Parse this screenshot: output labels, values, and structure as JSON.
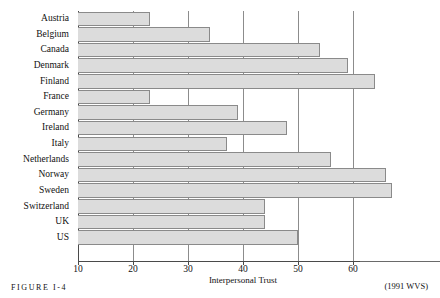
{
  "figure": {
    "caption": "FIGURE I-4",
    "source_note": "(1991 WVS)"
  },
  "chart_data": {
    "type": "bar",
    "orientation": "horizontal",
    "title": "",
    "xlabel": "Interpersonal Trust",
    "ylabel": "",
    "xlim": [
      10,
      68
    ],
    "xticks": [
      10,
      20,
      30,
      40,
      50,
      60
    ],
    "xtick_labels": [
      "10",
      "20",
      "30",
      "40",
      "50",
      "60"
    ],
    "grid": true,
    "legend": false,
    "bar_color": "#dcdcdc",
    "bar_border_color": "#8a8a8a",
    "axis_color": "#4a4a4a",
    "categories": [
      "Austria",
      "Belgium",
      "Canada",
      "Denmark",
      "Finland",
      "France",
      "Germany",
      "Ireland",
      "Italy",
      "Netherlands",
      "Norway",
      "Sweden",
      "Switzerland",
      "UK",
      "US"
    ],
    "values": [
      23,
      34,
      54,
      59,
      64,
      23,
      39,
      48,
      37,
      56,
      66,
      67,
      44,
      44,
      50
    ]
  }
}
